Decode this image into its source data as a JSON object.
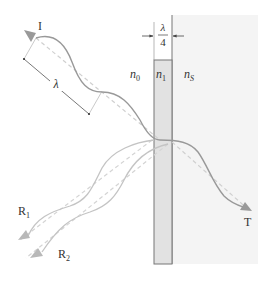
{
  "diagram": {
    "colors": {
      "substrate_fill": "#f4f4f4",
      "layer_fill": "#e2e2e2",
      "layer_stroke": "#777777",
      "wave_incident": "#999999",
      "wave_reflected": "#c4c4c4",
      "ray_dashed": "#d0d0d0",
      "text": "#333333"
    },
    "labels": {
      "incident": "I",
      "wavelength": "λ",
      "thickness_num": "λ",
      "thickness_den": "4",
      "medium_index": "n",
      "medium_index_sub": "0",
      "layer_index": "n",
      "layer_index_sub": "1",
      "substrate_index": "n",
      "substrate_index_sub": "S",
      "reflected_1": "R",
      "reflected_1_sub": "1",
      "reflected_2": "R",
      "reflected_2_sub": "2",
      "transmitted": "T"
    },
    "regions": [
      {
        "name": "ambient-medium",
        "index_label": "n0"
      },
      {
        "name": "coating-layer",
        "index_label": "n1",
        "thickness": "λ/4"
      },
      {
        "name": "substrate",
        "index_label": "nS"
      }
    ],
    "waves": [
      {
        "name": "incident",
        "label": "I",
        "direction": "toward coating"
      },
      {
        "name": "reflected-1",
        "label": "R1",
        "source": "front surface of coating"
      },
      {
        "name": "reflected-2",
        "label": "R2",
        "source": "coating/substrate interface"
      },
      {
        "name": "transmitted",
        "label": "T",
        "direction": "into substrate"
      }
    ]
  }
}
